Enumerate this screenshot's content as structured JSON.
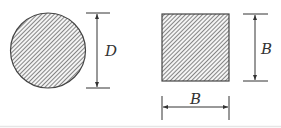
{
  "diagram": {
    "shapes": [
      {
        "type": "circle",
        "name": "circular-cross-section",
        "fill": "hatched"
      },
      {
        "type": "square",
        "name": "square-cross-section",
        "fill": "hatched"
      }
    ],
    "dimensions": {
      "circle_diameter_label": "D",
      "square_height_label": "B",
      "square_width_label": "B"
    },
    "colors": {
      "stroke": "#333333",
      "hatch": "#555555",
      "baseline": "#e6e6e6"
    }
  }
}
